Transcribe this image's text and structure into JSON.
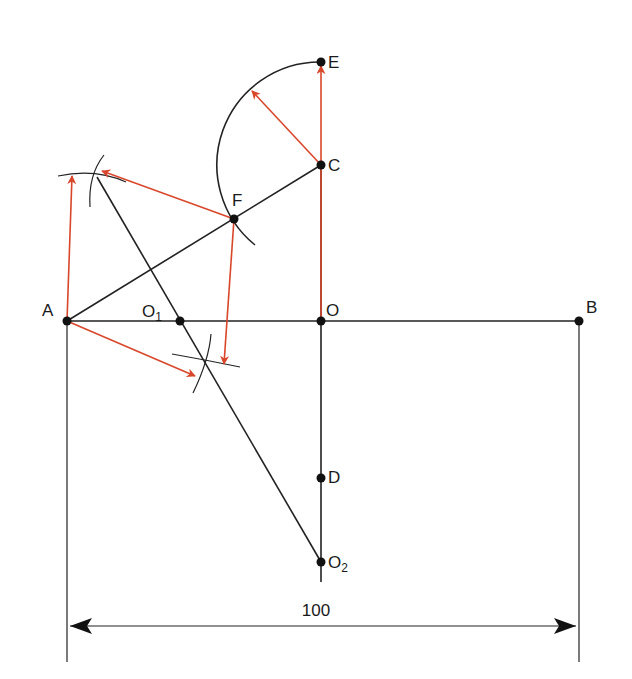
{
  "diagram": {
    "colors": {
      "construction": "#222222",
      "arrows": "#d9472b"
    },
    "points": [
      {
        "id": "A",
        "label": "A"
      },
      {
        "id": "O1",
        "label": "O",
        "subscript": "1"
      },
      {
        "id": "O",
        "label": "O"
      },
      {
        "id": "B",
        "label": "B"
      },
      {
        "id": "C",
        "label": "C"
      },
      {
        "id": "E",
        "label": "E"
      },
      {
        "id": "F",
        "label": "F"
      },
      {
        "id": "D",
        "label": "D"
      },
      {
        "id": "O2",
        "label": "O",
        "subscript": "2"
      }
    ],
    "dimension": {
      "value": "100"
    }
  }
}
